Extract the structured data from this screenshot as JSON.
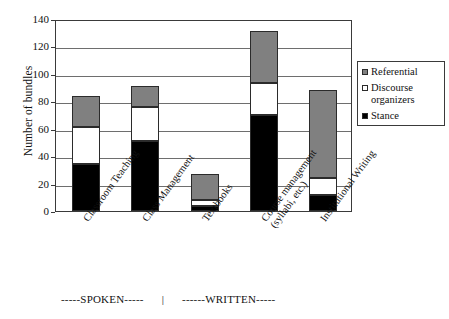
{
  "chart_data": {
    "type": "bar",
    "subtype": "stacked-bar",
    "title": "",
    "xlabel": "",
    "ylabel": "Number of bundles",
    "ylim": [
      0,
      140
    ],
    "ytick_step": 20,
    "yticks": [
      140,
      120,
      100,
      80,
      60,
      40,
      20,
      0
    ],
    "grid": true,
    "legend_position": "right",
    "categories": [
      "Classroom Teaching",
      "Class Management",
      "Textbooks",
      "Course management (syllabi, etc.)",
      "Institutional Writing"
    ],
    "series": [
      {
        "name": "Stance",
        "color": "#000000",
        "values": [
          34,
          51,
          4,
          70,
          12
        ]
      },
      {
        "name": "Discourse organizers",
        "color": "#ffffff",
        "values": [
          27,
          25,
          4,
          23,
          12
        ]
      },
      {
        "name": "Referential",
        "color": "#808080",
        "values": [
          23,
          15,
          19,
          38,
          64
        ]
      }
    ],
    "totals": [
      84,
      91,
      27,
      131,
      88
    ],
    "legend_order": [
      "Referential",
      "Discourse organizers",
      "Stance"
    ]
  },
  "axis": {
    "y_title": "Number of bundles",
    "y_ticks": [
      "140",
      "120",
      "100",
      "80",
      "60",
      "40",
      "20",
      "0"
    ]
  },
  "categories": [
    {
      "line1": "Classroom Teaching",
      "line2": ""
    },
    {
      "line1": "Class Management",
      "line2": ""
    },
    {
      "line1": "Textbooks",
      "line2": ""
    },
    {
      "line1": "Course management",
      "line2": "(syllabi, etc.)"
    },
    {
      "line1": "Institutional Writing",
      "line2": ""
    }
  ],
  "legend": {
    "items": [
      {
        "label": "Referential",
        "label2": "",
        "color": "#808080"
      },
      {
        "label": "Discourse",
        "label2": "organizers",
        "color": "#ffffff"
      },
      {
        "label": "Stance",
        "label2": "",
        "color": "#000000"
      }
    ]
  },
  "register": {
    "spoken": "-----SPOKEN-----",
    "divider": "|",
    "written": "------WRITTEN-----"
  },
  "colors": {
    "stance": "#000000",
    "discourse": "#ffffff",
    "referential": "#808080",
    "axis": "#3a3a3a",
    "grid": "#6e6e6e",
    "background": "#ffffff"
  }
}
